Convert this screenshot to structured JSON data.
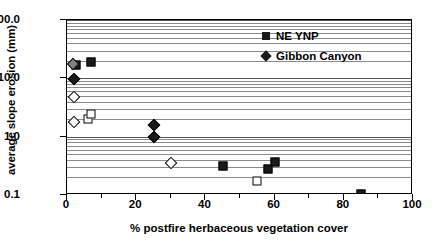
{
  "chart_data": {
    "type": "scatter",
    "title": "",
    "xlabel": "% postfire herbaceous vegetation cover",
    "ylabel": "average slope erosion (mm)",
    "xlim": [
      0,
      100
    ],
    "ylim": [
      0.1,
      100.0
    ],
    "yscale": "log",
    "grid": true,
    "grid_detail": "horizontal major and minor log gridlines",
    "legend_position": "top-right inside plot",
    "xticks": [
      0,
      20,
      40,
      60,
      80,
      100
    ],
    "xtick_labels": [
      "0",
      "20",
      "40",
      "60",
      "80",
      "100"
    ],
    "xminor_ticks": [
      10,
      30,
      50,
      70,
      90
    ],
    "yticks": [
      0.1,
      1.0,
      10.0,
      100.0
    ],
    "ytick_labels": [
      "0.1",
      "1.0",
      "10.0",
      "100.0"
    ],
    "legend": [
      {
        "name": "NE YNP",
        "marker": "square",
        "fill": "filled",
        "color": "#1a1a1a"
      },
      {
        "name": "Gibbon Canyon",
        "marker": "diamond",
        "fill": "filled",
        "color": "#1a1a1a"
      }
    ],
    "series": [
      {
        "name": "NE YNP",
        "marker": "square",
        "fill": "filled",
        "points": [
          {
            "x": 2.5,
            "y": 17.0
          },
          {
            "x": 7.0,
            "y": 19.0
          },
          {
            "x": 45.0,
            "y": 0.32
          },
          {
            "x": 58.0,
            "y": 0.28
          },
          {
            "x": 60.0,
            "y": 0.37
          },
          {
            "x": 85.0,
            "y": 0.105
          }
        ]
      },
      {
        "name": "NE YNP (open)",
        "marker": "square",
        "fill": "open",
        "points": [
          {
            "x": 6.0,
            "y": 2.0
          },
          {
            "x": 7.0,
            "y": 2.4
          },
          {
            "x": 55.0,
            "y": 0.175
          }
        ]
      },
      {
        "name": "Gibbon Canyon",
        "marker": "diamond",
        "fill": "filled",
        "points": [
          {
            "x": 2.0,
            "y": 9.6
          },
          {
            "x": 25.0,
            "y": 1.6
          },
          {
            "x": 25.0,
            "y": 1.0
          }
        ]
      },
      {
        "name": "Gibbon Canyon (gray)",
        "marker": "diamond",
        "fill": "gray",
        "points": [
          {
            "x": 1.8,
            "y": 17.5
          }
        ]
      },
      {
        "name": "Gibbon Canyon (open)",
        "marker": "diamond",
        "fill": "open",
        "points": [
          {
            "x": 2.0,
            "y": 4.8
          },
          {
            "x": 2.0,
            "y": 1.75
          },
          {
            "x": 30.0,
            "y": 0.35
          }
        ]
      }
    ]
  }
}
